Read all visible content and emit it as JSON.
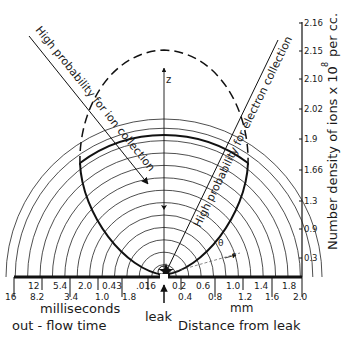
{
  "diagram": {
    "annotations": {
      "ion_collection": "High probability for ion collection",
      "electron_collection": "High probability for electron collection",
      "z_axis": "z",
      "theta": "θ",
      "r": "r",
      "leak": "leak"
    },
    "bottom_axis": {
      "time_unit": "milliseconds",
      "time_title": "out - flow   time",
      "time_ticks_upper": [
        "12",
        "5.4",
        "2.0",
        "0.43",
        ".016"
      ],
      "time_ticks_lower": [
        "16",
        "8.2",
        "3.4",
        "1.0",
        "1.8"
      ],
      "distance_unit": "mm",
      "distance_title": "Distance from leak",
      "distance_ticks_upper": [
        "0.2",
        "0.6",
        "1.0",
        "1.4",
        "1.8"
      ],
      "distance_ticks_lower": [
        "0.4",
        "0.8",
        "1.2",
        "1.6",
        "2.0"
      ]
    },
    "right_axis": {
      "title": "Number density  of ions x 10",
      "exponent": "8",
      "unit": "per cc.",
      "ticks": [
        "2.16",
        "2.15",
        "2.10",
        "2.02",
        "1.9",
        "1.66",
        "1.3",
        "0.9",
        "0.3"
      ]
    }
  }
}
